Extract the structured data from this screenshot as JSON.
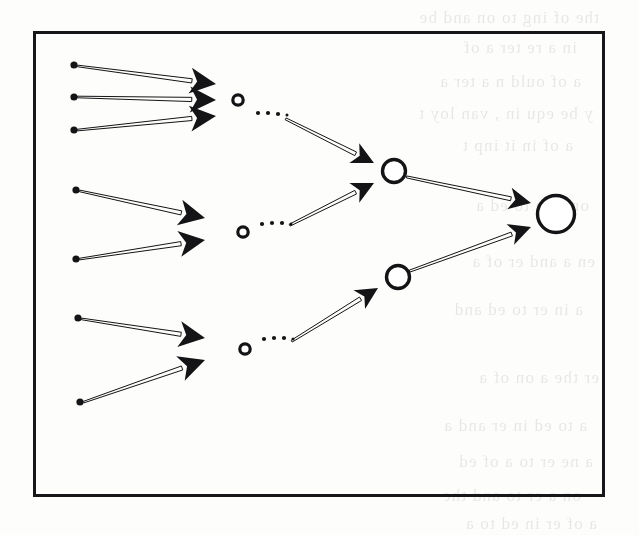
{
  "figure": {
    "kind": "hierarchical-aggregation-tree",
    "caption": "",
    "border_color": "#17171a",
    "ink_color": "#141416",
    "paper_color": "#fdfdfc",
    "box": {
      "x": 33,
      "y": 31,
      "width": 572,
      "height": 466
    }
  },
  "ghost_text": {
    "note": "faint bleed-through text from the reverse side of the scanned page",
    "lines": [
      {
        "text": "the of ing to on and be",
        "x": 40,
        "y": 8
      },
      {
        "text": "in a re ter a of",
        "x": 62,
        "y": 38
      },
      {
        "text": "a of ould n a ter a",
        "x": 58,
        "y": 72
      },
      {
        "text": "y be equ in , van loy t",
        "x": 46,
        "y": 104
      },
      {
        "text": "a of in it inp t",
        "x": 66,
        "y": 136
      },
      {
        "text": "on er a to ed a",
        "x": 50,
        "y": 196
      },
      {
        "text": "en a and er of a",
        "x": 44,
        "y": 252
      },
      {
        "text": "a in er to ed and",
        "x": 56,
        "y": 300
      },
      {
        "text": "er the a on of a",
        "x": 40,
        "y": 368
      },
      {
        "text": "a to ed in er and a",
        "x": 52,
        "y": 416
      },
      {
        "text": "a ne er to a of ed",
        "x": 46,
        "y": 452
      },
      {
        "text": "on a er to and the",
        "x": 58,
        "y": 486
      },
      {
        "text": "a of er in ed to a",
        "x": 42,
        "y": 514
      }
    ]
  },
  "nodes": {
    "leaves": [
      {
        "id": "leaf-1",
        "cluster": 1,
        "x": 74,
        "y": 65
      },
      {
        "id": "leaf-2",
        "cluster": 1,
        "x": 74,
        "y": 97
      },
      {
        "id": "leaf-3",
        "cluster": 1,
        "x": 74,
        "y": 130
      },
      {
        "id": "leaf-4",
        "cluster": 2,
        "x": 76,
        "y": 190
      },
      {
        "id": "leaf-5",
        "cluster": 2,
        "x": 76,
        "y": 259
      },
      {
        "id": "leaf-6",
        "cluster": 3,
        "x": 78,
        "y": 318
      },
      {
        "id": "leaf-7",
        "cluster": 3,
        "x": 80,
        "y": 402
      }
    ],
    "leaf_radius": 3.6,
    "level1": [
      {
        "id": "node-l1-a",
        "x": 238,
        "y": 100,
        "r": 5.2
      },
      {
        "id": "node-l1-b",
        "x": 243,
        "y": 232,
        "r": 5.2
      },
      {
        "id": "node-l1-c",
        "x": 245,
        "y": 349,
        "r": 5.2
      }
    ],
    "level2": [
      {
        "id": "node-l2-a",
        "x": 394,
        "y": 171,
        "r": 11.5
      },
      {
        "id": "node-l2-b",
        "x": 398,
        "y": 277,
        "r": 11.5
      }
    ],
    "root": {
      "id": "node-root",
      "x": 556,
      "y": 214,
      "r": 18.5
    }
  },
  "edges": {
    "to_level1": [
      {
        "from": "leaf-1",
        "to": "node-l1-a",
        "x1": 78,
        "y1": 66,
        "x2": 216,
        "y2": 84
      },
      {
        "from": "leaf-2",
        "to": "node-l1-a",
        "x1": 78,
        "y1": 97,
        "x2": 216,
        "y2": 100
      },
      {
        "from": "leaf-3",
        "to": "node-l1-a",
        "x1": 78,
        "y1": 130,
        "x2": 216,
        "y2": 116
      },
      {
        "from": "leaf-4",
        "to": "node-l1-b",
        "x1": 80,
        "y1": 191,
        "x2": 205,
        "y2": 218
      },
      {
        "from": "leaf-5",
        "to": "node-l1-b",
        "x1": 80,
        "y1": 259,
        "x2": 205,
        "y2": 240
      },
      {
        "from": "leaf-6",
        "to": "node-l1-c",
        "x1": 82,
        "y1": 319,
        "x2": 205,
        "y2": 338
      },
      {
        "from": "leaf-7",
        "to": "node-l1-c",
        "x1": 84,
        "y1": 402,
        "x2": 205,
        "y2": 360
      }
    ],
    "to_level2": [
      {
        "from": "node-l1-a",
        "to": "node-l2-a",
        "x1": 286,
        "y1": 119,
        "x2": 374,
        "y2": 163
      },
      {
        "from": "node-l1-b",
        "to": "node-l2-a",
        "x1": 290,
        "y1": 225,
        "x2": 374,
        "y2": 183
      },
      {
        "from": "node-l1-c",
        "to": "node-l2-b",
        "x1": 292,
        "y1": 341,
        "x2": 378,
        "y2": 288
      }
    ],
    "to_root": [
      {
        "from": "node-l2-a",
        "to": "node-root",
        "x1": 407,
        "y1": 177,
        "x2": 531,
        "y2": 203
      },
      {
        "from": "node-l2-b",
        "to": "node-root",
        "x1": 410,
        "y1": 271,
        "x2": 531,
        "y2": 227
      }
    ],
    "ellipses": [
      {
        "after": "node-l1-a",
        "dots": [
          {
            "x": 258,
            "y": 113
          },
          {
            "x": 268,
            "y": 113
          },
          {
            "x": 278,
            "y": 114
          },
          {
            "x": 287,
            "y": 115
          }
        ]
      },
      {
        "after": "node-l1-b",
        "dots": [
          {
            "x": 262,
            "y": 224
          },
          {
            "x": 272,
            "y": 223
          },
          {
            "x": 282,
            "y": 223
          },
          {
            "x": 291,
            "y": 224
          }
        ]
      },
      {
        "after": "node-l1-c",
        "dots": [
          {
            "x": 264,
            "y": 339
          },
          {
            "x": 274,
            "y": 338
          },
          {
            "x": 284,
            "y": 338
          },
          {
            "x": 293,
            "y": 339
          }
        ]
      }
    ]
  },
  "legend": {
    "leaf_label": "input unit",
    "level1_label": "first-stage node",
    "level2_label": "second-stage node",
    "root_label": "output node"
  }
}
